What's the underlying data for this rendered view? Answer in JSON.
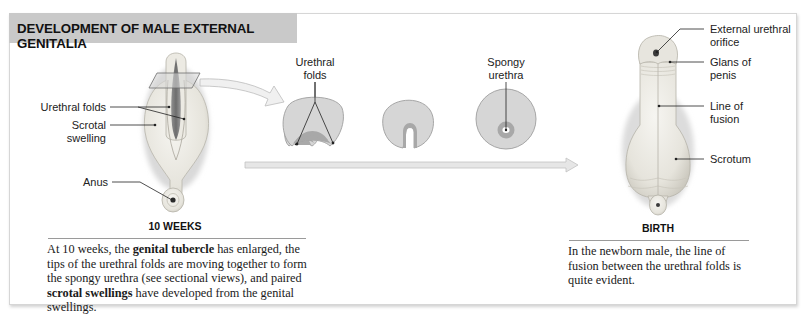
{
  "header": {
    "title": "DEVELOPMENT OF MALE EXTERNAL GENITALIA"
  },
  "stage_10_weeks": {
    "label": "10 WEEKS",
    "labels": {
      "urethral_folds": "Urethral folds",
      "scrotal_swelling_line1": "Scrotal",
      "scrotal_swelling_line2": "swelling",
      "anus": "Anus"
    },
    "caption": {
      "t1": "At 10 weeks, the ",
      "b1": "genital tubercle",
      "t2": " has enlarged, the tips of the urethral folds are moving together to form the spongy urethra (see sectional views), and paired ",
      "b2": "scrotal swellings",
      "t3": " have developed from the genital swellings."
    }
  },
  "sectional_views": {
    "urethral_folds_line1": "Urethral",
    "urethral_folds_line2": "folds",
    "spongy_urethra_line1": "Spongy",
    "spongy_urethra_line2": "urethra"
  },
  "stage_birth": {
    "label": "BIRTH",
    "labels": {
      "external_urethral_orifice_line1": "External urethral",
      "external_urethral_orifice_line2": "orifice",
      "glans_line1": "Glans of",
      "glans_line2": "penis",
      "line_of_fusion_line1": "Line of",
      "line_of_fusion_line2": "fusion",
      "scrotum": "Scrotum"
    },
    "caption": "In the newborn male, the line of fusion between the urethral folds is quite evident."
  },
  "colors": {
    "header_bg": "#c9c9c9",
    "tissue": "#e9e7e0",
    "section_fill": "#d4d4d4",
    "section_dark": "#a8a8a8",
    "arrow_fill": "#ececec"
  }
}
